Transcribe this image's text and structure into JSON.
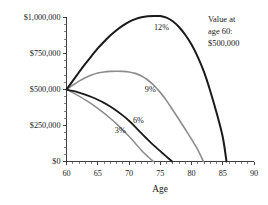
{
  "chart_data": {
    "type": "line",
    "title": "",
    "xlabel": "Age",
    "ylabel": "",
    "xlim": [
      60,
      90
    ],
    "ylim": [
      0,
      1000000
    ],
    "grid": false,
    "legend": "inline-curve-labels",
    "x_ticks": [
      60,
      65,
      70,
      75,
      80,
      85,
      90
    ],
    "x_tick_labels": [
      "60",
      "65",
      "70",
      "75",
      "80",
      "85",
      "90"
    ],
    "x_minor_step": 1,
    "y_ticks": [
      0,
      250000,
      500000,
      750000,
      1000000
    ],
    "y_tick_labels": [
      "$0",
      "$250,000",
      "$500,000",
      "$750,000",
      "$1,000,000"
    ],
    "y_minor_step": 50000,
    "annotation": {
      "line1": "Value at",
      "line2": "age 60:",
      "line3": "$500,000"
    },
    "series": [
      {
        "name": "3%",
        "label": "3%",
        "color": "#8c8c8c",
        "width": 1.5,
        "points": [
          [
            60,
            500000
          ],
          [
            61,
            478000
          ],
          [
            62,
            454000
          ],
          [
            63,
            428000
          ],
          [
            64,
            400000
          ],
          [
            65,
            369000
          ],
          [
            66,
            336000
          ],
          [
            67,
            300000
          ],
          [
            68,
            261000
          ],
          [
            69,
            219000
          ],
          [
            70,
            175000
          ],
          [
            71,
            127000
          ],
          [
            72,
            77000
          ],
          [
            73,
            35000
          ],
          [
            73.9,
            0
          ]
        ]
      },
      {
        "name": "6%",
        "label": "6%",
        "color": "#1a1a1a",
        "width": 1.8,
        "points": [
          [
            60,
            500000
          ],
          [
            61,
            490000
          ],
          [
            62,
            478000
          ],
          [
            63,
            464000
          ],
          [
            64,
            448000
          ],
          [
            65,
            429000
          ],
          [
            66,
            407000
          ],
          [
            67,
            382000
          ],
          [
            68,
            353000
          ],
          [
            69,
            320000
          ],
          [
            70,
            283000
          ],
          [
            71,
            241000
          ],
          [
            72,
            195000
          ],
          [
            73,
            152000
          ],
          [
            74,
            110000
          ],
          [
            75,
            72000
          ],
          [
            76,
            34000
          ],
          [
            76.9,
            0
          ]
        ]
      },
      {
        "name": "9%",
        "label": "9%",
        "color": "#8c8c8c",
        "width": 1.6,
        "points": [
          [
            60,
            500000
          ],
          [
            61,
            530000
          ],
          [
            62,
            558000
          ],
          [
            63,
            581000
          ],
          [
            64,
            600000
          ],
          [
            65,
            614000
          ],
          [
            66,
            622000
          ],
          [
            67,
            626000
          ],
          [
            68,
            627000
          ],
          [
            69,
            626000
          ],
          [
            70,
            622000
          ],
          [
            71,
            612000
          ],
          [
            72,
            594000
          ],
          [
            73,
            566000
          ],
          [
            74,
            528000
          ],
          [
            75,
            480000
          ],
          [
            76,
            423000
          ],
          [
            77,
            358000
          ],
          [
            78,
            292000
          ],
          [
            79,
            224000
          ],
          [
            80,
            155000
          ],
          [
            81,
            82000
          ],
          [
            81.9,
            0
          ]
        ]
      },
      {
        "name": "12%",
        "label": "12%",
        "color": "#1a1a1a",
        "width": 2.0,
        "points": [
          [
            60,
            500000
          ],
          [
            61,
            560000
          ],
          [
            62,
            620000
          ],
          [
            63,
            678000
          ],
          [
            64,
            732000
          ],
          [
            65,
            785000
          ],
          [
            66,
            832000
          ],
          [
            67,
            875000
          ],
          [
            68,
            912000
          ],
          [
            69,
            944000
          ],
          [
            70,
            970000
          ],
          [
            71,
            989000
          ],
          [
            72,
            1002000
          ],
          [
            73,
            1009000
          ],
          [
            74,
            1011000
          ],
          [
            75,
            1010000
          ],
          [
            76,
            999000
          ],
          [
            77,
            974000
          ],
          [
            78,
            934000
          ],
          [
            79,
            880000
          ],
          [
            80,
            812000
          ],
          [
            81,
            727000
          ],
          [
            82,
            622000
          ],
          [
            83,
            490000
          ],
          [
            84,
            340000
          ],
          [
            85,
            170000
          ],
          [
            85.6,
            0
          ]
        ]
      }
    ],
    "series_label_positions": [
      {
        "name": "3%",
        "x": 68.6,
        "y": 200000
      },
      {
        "name": "6%",
        "x": 71.5,
        "y": 270000
      },
      {
        "name": "9%",
        "x": 73.4,
        "y": 480000
      },
      {
        "name": "12%",
        "x": 75.2,
        "y": 915000
      }
    ]
  }
}
